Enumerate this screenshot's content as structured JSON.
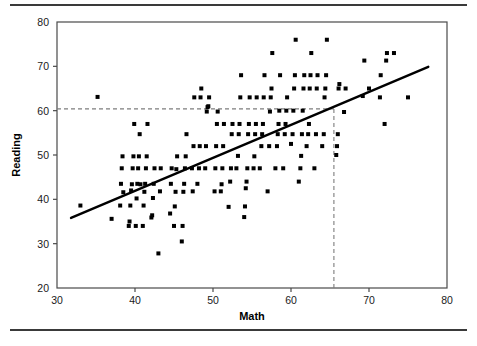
{
  "figure": {
    "top_rule": "horizontal-rule",
    "bottom_rule": "horizontal-rule"
  },
  "chart_data": {
    "type": "scatter",
    "title": "",
    "xlabel": "Math",
    "ylabel": "Reading",
    "xlim": [
      30,
      80
    ],
    "ylim": [
      20,
      80
    ],
    "xticks": [
      30,
      40,
      50,
      60,
      70,
      80
    ],
    "yticks": [
      20,
      30,
      40,
      50,
      60,
      70,
      80
    ],
    "xtick_labels": [
      "30",
      "40",
      "50",
      "60",
      "70",
      "80"
    ],
    "ytick_labels": [
      "20",
      "30",
      "40",
      "50",
      "60",
      "70",
      "80"
    ],
    "grid": false,
    "legend": null,
    "marker": "square",
    "marker_color": "#000000",
    "marker_size": 4,
    "trend_line": {
      "type": "linear-regression",
      "color": "#000000",
      "width": 2.4,
      "x_start": 31.8,
      "y_start": 35.8,
      "x_end": 77.6,
      "y_end": 69.9
    },
    "reference_lines": [
      {
        "orientation": "horizontal",
        "value": 60.4,
        "style": "dashed",
        "color": "#7d7d7d",
        "from": 30,
        "to": 65.5
      },
      {
        "orientation": "vertical",
        "value": 65.5,
        "style": "dashed",
        "color": "#7d7d7d",
        "from": 20,
        "to": 60.4
      }
    ],
    "points": [
      [
        33.0,
        38.6
      ],
      [
        35.2,
        63.1
      ],
      [
        37.0,
        35.6
      ],
      [
        38.1,
        38.6
      ],
      [
        38.2,
        43.5
      ],
      [
        38.3,
        47.0
      ],
      [
        38.4,
        49.7
      ],
      [
        38.5,
        41.6
      ],
      [
        39.2,
        34.0
      ],
      [
        39.3,
        35.0
      ],
      [
        39.4,
        38.6
      ],
      [
        39.5,
        42.0
      ],
      [
        39.6,
        43.4
      ],
      [
        39.7,
        47.0
      ],
      [
        39.8,
        49.7
      ],
      [
        39.9,
        57.0
      ],
      [
        40.1,
        34.0
      ],
      [
        40.2,
        40.2
      ],
      [
        40.3,
        43.5
      ],
      [
        40.4,
        47.0
      ],
      [
        40.5,
        49.7
      ],
      [
        40.6,
        54.7
      ],
      [
        40.7,
        43.4
      ],
      [
        41.0,
        34.0
      ],
      [
        41.1,
        38.6
      ],
      [
        41.2,
        41.7
      ],
      [
        41.3,
        43.5
      ],
      [
        41.4,
        47.0
      ],
      [
        41.5,
        49.7
      ],
      [
        41.6,
        57.0
      ],
      [
        42.1,
        35.9
      ],
      [
        42.2,
        36.4
      ],
      [
        42.3,
        40.3
      ],
      [
        42.4,
        43.5
      ],
      [
        42.5,
        47.0
      ],
      [
        43.0,
        27.8
      ],
      [
        43.2,
        41.8
      ],
      [
        43.3,
        47.0
      ],
      [
        44.5,
        36.8
      ],
      [
        44.6,
        43.5
      ],
      [
        44.7,
        47.0
      ],
      [
        45.0,
        34.0
      ],
      [
        45.1,
        38.4
      ],
      [
        45.2,
        41.7
      ],
      [
        45.3,
        46.8
      ],
      [
        45.4,
        49.7
      ],
      [
        46.0,
        30.5
      ],
      [
        46.1,
        34.0
      ],
      [
        46.2,
        41.7
      ],
      [
        46.3,
        43.5
      ],
      [
        46.4,
        47.0
      ],
      [
        46.5,
        49.7
      ],
      [
        46.6,
        54.7
      ],
      [
        47.3,
        47.0
      ],
      [
        47.4,
        41.8
      ],
      [
        47.5,
        52.0
      ],
      [
        47.6,
        63.0
      ],
      [
        48.0,
        43.5
      ],
      [
        48.2,
        47.0
      ],
      [
        48.3,
        52.0
      ],
      [
        48.4,
        63.0
      ],
      [
        48.5,
        65.0
      ],
      [
        49.0,
        47.0
      ],
      [
        49.1,
        52.0
      ],
      [
        49.2,
        59.8
      ],
      [
        49.3,
        60.8
      ],
      [
        49.4,
        61.0
      ],
      [
        49.5,
        63.0
      ],
      [
        50.2,
        41.8
      ],
      [
        50.3,
        47.0
      ],
      [
        50.4,
        52.0
      ],
      [
        50.5,
        57.0
      ],
      [
        50.6,
        59.8
      ],
      [
        51.0,
        41.8
      ],
      [
        51.1,
        43.4
      ],
      [
        51.2,
        47.0
      ],
      [
        51.3,
        52.0
      ],
      [
        51.4,
        57.0
      ],
      [
        52.0,
        38.3
      ],
      [
        52.2,
        44.0
      ],
      [
        52.3,
        47.0
      ],
      [
        52.4,
        54.7
      ],
      [
        52.5,
        57.0
      ],
      [
        53.0,
        47.0
      ],
      [
        53.2,
        49.8
      ],
      [
        53.3,
        54.7
      ],
      [
        53.4,
        57.0
      ],
      [
        53.5,
        63.0
      ],
      [
        53.6,
        68.0
      ],
      [
        54.0,
        36.0
      ],
      [
        54.1,
        38.4
      ],
      [
        54.2,
        42.5
      ],
      [
        54.3,
        44.0
      ],
      [
        54.4,
        47.0
      ],
      [
        54.5,
        54.7
      ],
      [
        54.6,
        57.0
      ],
      [
        54.7,
        63.0
      ],
      [
        55.2,
        47.0
      ],
      [
        55.3,
        49.7
      ],
      [
        55.4,
        54.7
      ],
      [
        55.5,
        57.0
      ],
      [
        55.6,
        63.0
      ],
      [
        56.0,
        47.0
      ],
      [
        56.2,
        52.0
      ],
      [
        56.3,
        54.7
      ],
      [
        56.4,
        57.0
      ],
      [
        56.5,
        63.0
      ],
      [
        56.6,
        68.0
      ],
      [
        57.0,
        41.8
      ],
      [
        57.2,
        52.0
      ],
      [
        57.3,
        59.8
      ],
      [
        57.4,
        63.0
      ],
      [
        57.5,
        65.0
      ],
      [
        57.6,
        73.0
      ],
      [
        58.0,
        47.0
      ],
      [
        58.2,
        52.0
      ],
      [
        58.3,
        54.7
      ],
      [
        58.4,
        57.0
      ],
      [
        58.5,
        60.0
      ],
      [
        58.6,
        68.0
      ],
      [
        59.0,
        47.0
      ],
      [
        59.2,
        54.7
      ],
      [
        59.3,
        57.0
      ],
      [
        59.4,
        60.0
      ],
      [
        59.5,
        63.0
      ],
      [
        60.0,
        52.5
      ],
      [
        60.2,
        54.7
      ],
      [
        60.3,
        60.0
      ],
      [
        60.4,
        65.0
      ],
      [
        60.5,
        68.0
      ],
      [
        60.6,
        76.0
      ],
      [
        61.0,
        44.0
      ],
      [
        61.2,
        47.0
      ],
      [
        61.3,
        49.8
      ],
      [
        61.4,
        54.7
      ],
      [
        61.5,
        60.0
      ],
      [
        61.6,
        65.0
      ],
      [
        61.7,
        68.0
      ],
      [
        62.0,
        52.0
      ],
      [
        62.2,
        54.7
      ],
      [
        62.3,
        57.0
      ],
      [
        62.4,
        65.0
      ],
      [
        62.5,
        68.0
      ],
      [
        62.6,
        73.0
      ],
      [
        63.0,
        47.0
      ],
      [
        63.2,
        54.7
      ],
      [
        63.3,
        65.0
      ],
      [
        63.4,
        68.0
      ],
      [
        64.0,
        52.0
      ],
      [
        64.2,
        54.7
      ],
      [
        64.3,
        63.0
      ],
      [
        64.4,
        65.0
      ],
      [
        64.5,
        68.0
      ],
      [
        64.6,
        76.0
      ],
      [
        65.8,
        50.0
      ],
      [
        65.9,
        52.0
      ],
      [
        66.0,
        54.7
      ],
      [
        66.1,
        65.0
      ],
      [
        66.2,
        66.0
      ],
      [
        66.8,
        59.7
      ],
      [
        67.0,
        65.0
      ],
      [
        69.2,
        63.3
      ],
      [
        69.4,
        71.3
      ],
      [
        70.0,
        65.0
      ],
      [
        71.4,
        63.0
      ],
      [
        71.5,
        68.0
      ],
      [
        72.0,
        57.0
      ],
      [
        72.2,
        71.3
      ],
      [
        72.3,
        73.0
      ],
      [
        73.2,
        73.0
      ],
      [
        75.0,
        63.0
      ]
    ]
  }
}
